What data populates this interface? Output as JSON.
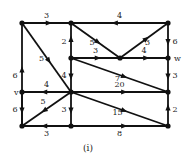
{
  "diagram": {
    "type": "directed-weighted-graph",
    "caption": "(i)",
    "nodes": [
      {
        "id": "A",
        "x": 22,
        "y": 23,
        "label": ""
      },
      {
        "id": "B",
        "x": 71,
        "y": 23,
        "label": ""
      },
      {
        "id": "C",
        "x": 168,
        "y": 23,
        "label": ""
      },
      {
        "id": "D",
        "x": 71,
        "y": 58,
        "label": ""
      },
      {
        "id": "E",
        "x": 120,
        "y": 58,
        "label": ""
      },
      {
        "id": "w",
        "x": 168,
        "y": 58,
        "label": "w"
      },
      {
        "id": "v",
        "x": 22,
        "y": 92,
        "label": "v"
      },
      {
        "id": "F",
        "x": 71,
        "y": 92,
        "label": ""
      },
      {
        "id": "G",
        "x": 168,
        "y": 92,
        "label": ""
      },
      {
        "id": "H",
        "x": 22,
        "y": 126,
        "label": ""
      },
      {
        "id": "I",
        "x": 71,
        "y": 126,
        "label": ""
      },
      {
        "id": "J",
        "x": 168,
        "y": 126,
        "label": ""
      }
    ],
    "edges": [
      {
        "from": "A",
        "to": "B",
        "weight": "3"
      },
      {
        "from": "C",
        "to": "B",
        "weight": "4"
      },
      {
        "from": "A",
        "to": "F",
        "weight": "5"
      },
      {
        "from": "H",
        "to": "A",
        "weight": "6"
      },
      {
        "from": "D",
        "to": "B",
        "weight": "2"
      },
      {
        "from": "B",
        "to": "E",
        "weight": "5"
      },
      {
        "from": "E",
        "to": "C",
        "weight": "3"
      },
      {
        "from": "C",
        "to": "w",
        "weight": "6"
      },
      {
        "from": "D",
        "to": "E",
        "weight": "3"
      },
      {
        "from": "E",
        "to": "w",
        "weight": "4"
      },
      {
        "from": "D",
        "to": "G",
        "weight": "7"
      },
      {
        "from": "D",
        "to": "F",
        "weight": "4"
      },
      {
        "from": "w",
        "to": "G",
        "weight": "3"
      },
      {
        "from": "F",
        "to": "v",
        "weight": "4"
      },
      {
        "from": "F",
        "to": "G",
        "weight": "20"
      },
      {
        "from": "v",
        "to": "H",
        "weight": "6"
      },
      {
        "from": "F",
        "to": "H",
        "weight": "5"
      },
      {
        "from": "F",
        "to": "I",
        "weight": "3"
      },
      {
        "from": "F",
        "to": "J",
        "weight": "15"
      },
      {
        "from": "J",
        "to": "G",
        "weight": "2"
      },
      {
        "from": "I",
        "to": "H",
        "weight": "3"
      },
      {
        "from": "I",
        "to": "J",
        "weight": "8"
      }
    ]
  }
}
